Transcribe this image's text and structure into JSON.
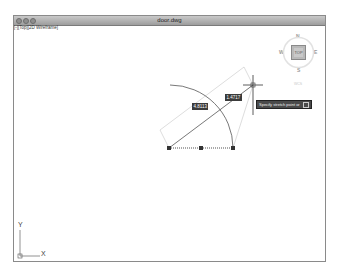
{
  "window": {
    "title": "door.dwg",
    "view_label": "[-][Top][2D Wireframe]"
  },
  "viewcube": {
    "north": "N",
    "south": "S",
    "east": "E",
    "west": "W",
    "face": "TOP",
    "wcs_label": "WCS"
  },
  "drawing": {
    "dimension_1": "4.8113",
    "dimension_2": "1.4717",
    "command_prompt": "Specify stretch point or"
  },
  "ucs": {
    "x_label": "X",
    "y_label": "Y"
  }
}
